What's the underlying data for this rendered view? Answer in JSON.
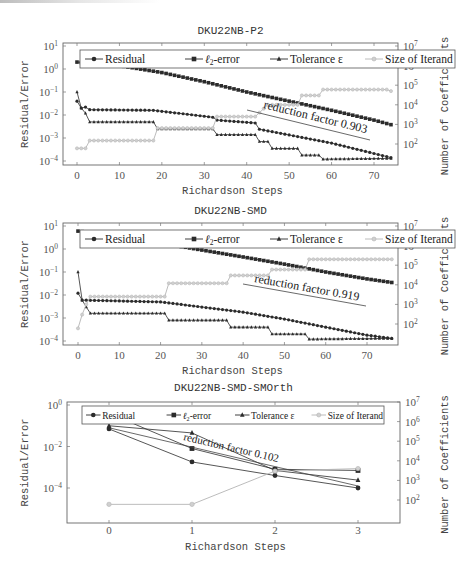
{
  "chart_data": [
    {
      "type": "line",
      "title": "DKU22NB-P2",
      "xlabel": "Richardson Steps",
      "ylabel": "Residual/Error",
      "y2label": "Number of Coefficients",
      "xticks": [
        0,
        10,
        20,
        30,
        40,
        50,
        60,
        70
      ],
      "yticks": [
        "10^1",
        "10^0",
        "10^-1",
        "10^-2",
        "10^-3",
        "10^-4"
      ],
      "y2ticks": [
        "10^7",
        "10^6",
        "10^5",
        "10^4",
        "10^3",
        "10^2"
      ],
      "ylim": [
        0.0001,
        10
      ],
      "y2lim": [
        10,
        10000000
      ],
      "xlim": [
        -2,
        76
      ],
      "yscale": "log",
      "legend": [
        "Residual",
        "ℓ2-error",
        "Tolerance ε",
        "Size of Iterand"
      ],
      "legend_position": "top inside",
      "annotation": "reduction factor 0.903",
      "series": [
        {
          "name": "Residual",
          "marker": "circle",
          "x_range": [
            0,
            74
          ],
          "keypoints": [
            [
              0,
              0.04
            ],
            [
              1,
              0.02
            ],
            [
              2,
              0.022
            ],
            [
              3,
              0.017
            ],
            [
              18,
              0.016
            ],
            [
              32,
              0.008
            ],
            [
              33,
              0.006
            ],
            [
              42,
              0.0045
            ],
            [
              43,
              0.0024
            ],
            [
              60,
              0.0006
            ],
            [
              74,
              0.00014
            ]
          ]
        },
        {
          "name": "ℓ2-error",
          "marker": "square",
          "x_range": [
            0,
            74
          ],
          "keypoints": [
            [
              0,
              2.0
            ],
            [
              10,
              1.4
            ],
            [
              20,
              0.7
            ],
            [
              30,
              0.28
            ],
            [
              40,
              0.1
            ],
            [
              50,
              0.04
            ],
            [
              60,
              0.016
            ],
            [
              70,
              0.006
            ],
            [
              74,
              0.0038
            ]
          ]
        },
        {
          "name": "Tolerance ε",
          "marker": "triangle",
          "x_range": [
            0,
            74
          ],
          "keypoints": [
            [
              0,
              0.1
            ],
            [
              1,
              0.02
            ],
            [
              2,
              0.012
            ],
            [
              3,
              0.005
            ],
            [
              18,
              0.005
            ],
            [
              19,
              0.0025
            ],
            [
              32,
              0.0025
            ],
            [
              33,
              0.0014
            ],
            [
              42,
              0.0014
            ],
            [
              43,
              0.0007
            ],
            [
              45,
              0.0007
            ],
            [
              46,
              0.00035
            ],
            [
              52,
              0.00035
            ],
            [
              53,
              0.00018
            ],
            [
              57,
              0.00018
            ],
            [
              58,
              0.00012
            ],
            [
              74,
              0.00013
            ]
          ]
        },
        {
          "name": "Size of Iterand",
          "axis": "right",
          "marker": "circle",
          "x_range": [
            0,
            74
          ],
          "keypoints": [
            [
              0,
              60
            ],
            [
              2,
              60
            ],
            [
              3,
              150
            ],
            [
              18,
              150
            ],
            [
              19,
              650
            ],
            [
              32,
              650
            ],
            [
              33,
              2500
            ],
            [
              42,
              2500
            ],
            [
              43,
              4000
            ],
            [
              45,
              10000
            ],
            [
              52,
              10000
            ],
            [
              53,
              30000
            ],
            [
              57,
              30000
            ],
            [
              58,
              60000
            ],
            [
              73,
              60000
            ],
            [
              74,
              50000
            ]
          ]
        }
      ]
    },
    {
      "type": "line",
      "title": "DKU22NB-SMD",
      "xlabel": "Richardson Steps",
      "ylabel": "Residual/Error",
      "y2label": "Number of Coefficients",
      "xticks": [
        0,
        10,
        20,
        30,
        40,
        50,
        60,
        70
      ],
      "yticks": [
        "10^1",
        "10^0",
        "10^-1",
        "10^-2",
        "10^-3",
        "10^-4"
      ],
      "y2ticks": [
        "10^7",
        "10^6",
        "10^5",
        "10^4",
        "10^3",
        "10^2"
      ],
      "ylim": [
        0.0001,
        10
      ],
      "y2lim": [
        10,
        10000000
      ],
      "xlim": [
        -2,
        78
      ],
      "yscale": "log",
      "legend": [
        "Residual",
        "ℓ2-error",
        "Tolerance ε",
        "Size of Iterand"
      ],
      "legend_position": "top inside",
      "annotation": "reduction factor 0.919",
      "series": [
        {
          "name": "Residual",
          "marker": "circle",
          "x_range": [
            0,
            76
          ],
          "keypoints": [
            [
              0,
              0.012
            ],
            [
              1,
              0.006
            ],
            [
              20,
              0.005
            ],
            [
              30,
              0.003
            ],
            [
              40,
              0.0018
            ],
            [
              50,
              0.0009
            ],
            [
              60,
              0.0004
            ],
            [
              70,
              0.00018
            ],
            [
              76,
              0.00013
            ]
          ]
        },
        {
          "name": "ℓ2-error",
          "marker": "square",
          "x_range": [
            0,
            76
          ],
          "keypoints": [
            [
              0,
              6.0
            ],
            [
              10,
              3.5
            ],
            [
              20,
              1.8
            ],
            [
              30,
              0.9
            ],
            [
              40,
              0.45
            ],
            [
              50,
              0.22
            ],
            [
              60,
              0.1
            ],
            [
              70,
              0.05
            ],
            [
              76,
              0.035
            ]
          ]
        },
        {
          "name": "Tolerance ε",
          "marker": "triangle",
          "x_range": [
            0,
            76
          ],
          "keypoints": [
            [
              0,
              0.1
            ],
            [
              1,
              0.006
            ],
            [
              2,
              0.003
            ],
            [
              3,
              0.0016
            ],
            [
              21,
              0.0016
            ],
            [
              22,
              0.0008
            ],
            [
              36,
              0.0008
            ],
            [
              37,
              0.0004
            ],
            [
              46,
              0.0004
            ],
            [
              47,
              0.0002
            ],
            [
              55,
              0.0002
            ],
            [
              56,
              0.00012
            ],
            [
              76,
              0.00013
            ]
          ]
        },
        {
          "name": "Size of Iterand",
          "axis": "right",
          "marker": "circle",
          "x_range": [
            0,
            76
          ],
          "keypoints": [
            [
              0,
              60
            ],
            [
              1,
              300
            ],
            [
              2,
              1000
            ],
            [
              3,
              2500
            ],
            [
              21,
              2500
            ],
            [
              22,
              12000
            ],
            [
              36,
              12000
            ],
            [
              37,
              30000
            ],
            [
              46,
              30000
            ],
            [
              47,
              60000
            ],
            [
              55,
              60000
            ],
            [
              56,
              200000
            ],
            [
              76,
              200000
            ]
          ]
        }
      ]
    },
    {
      "type": "line",
      "title": "DKU22NB-SMD-SMOrth",
      "xlabel": "Richardson Steps",
      "ylabel": "Residual/Error",
      "y2label": "Number of Coefficients",
      "xticks": [
        0,
        1,
        2,
        3
      ],
      "yticks": [
        "10^0",
        "10^-2",
        "10^-4"
      ],
      "y2ticks": [
        "10^7",
        "10^6",
        "10^5",
        "10^4",
        "10^3",
        "10^2"
      ],
      "ylim": [
        1e-05,
        10
      ],
      "y2lim": [
        10,
        10000000
      ],
      "xlim": [
        -0.5,
        3.5
      ],
      "yscale": "log",
      "legend": [
        "Residual",
        "ℓ2-error",
        "Tolerance ε",
        "Size of Iterand"
      ],
      "legend_position": "top inside",
      "annotation": "reduction factor 0.102",
      "x": [
        0,
        1,
        2,
        3
      ],
      "series": [
        {
          "name": "Residual",
          "marker": "circle",
          "values": [
            0.07,
            0.0018,
            0.0004,
            0.0001
          ]
        },
        {
          "name": "ℓ2-error",
          "marker": "square",
          "values": [
            0.4,
            0.008,
            0.0008,
            0.0007
          ]
        },
        {
          "name": "Tolerance ε",
          "marker": "triangle",
          "values": [
            0.1,
            0.045,
            0.0007,
            0.00024
          ]
        },
        {
          "name": "Size of Iterand",
          "axis": "right",
          "marker": "circle",
          "values": [
            60,
            60,
            3000,
            4000
          ]
        }
      ]
    }
  ],
  "charts": [
    {
      "title": "DKU22NB-P2",
      "annotation": "reduction factor 0.903"
    },
    {
      "title": "DKU22NB-SMD",
      "annotation": "reduction factor 0.919"
    },
    {
      "title": "DKU22NB-SMD-SMOrth",
      "annotation": "reduction factor 0.102"
    }
  ],
  "labels": {
    "xlabel": "Richardson Steps",
    "ylabel": "Residual/Error",
    "y2label": "Number of Coefficients",
    "legend_residual": "Residual",
    "legend_l2": "-error",
    "legend_tol": "Tolerance ε",
    "legend_size": "Size of Iterand"
  },
  "colors": {
    "dark": "#2b2b2b",
    "gray": "#b4b4b4",
    "axis": "#555555"
  }
}
